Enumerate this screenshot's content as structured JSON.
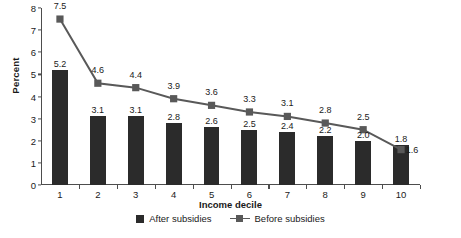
{
  "chart_data": {
    "type": "bar",
    "title": "",
    "xlabel": "Income decile",
    "ylabel": "Percent",
    "categories": [
      "1",
      "2",
      "3",
      "4",
      "5",
      "6",
      "7",
      "8",
      "9",
      "10"
    ],
    "ylim": [
      0,
      8
    ],
    "yticks": [
      "0",
      "1",
      "2",
      "3",
      "4",
      "5",
      "6",
      "7",
      "8"
    ],
    "grid": false,
    "legend_position": "bottom",
    "series": [
      {
        "name": "After subsidies",
        "kind": "bar",
        "color": "#2b2b2b",
        "values": [
          5.2,
          3.1,
          3.1,
          2.8,
          2.6,
          2.5,
          2.4,
          2.2,
          2.0,
          1.8
        ],
        "labels": [
          "5.2",
          "3.1",
          "3.1",
          "2.8",
          "2.6",
          "2.5",
          "2.4",
          "2.2",
          "2.0",
          "1.8"
        ]
      },
      {
        "name": "Before subsidies",
        "kind": "line",
        "color": "#595959",
        "values": [
          7.5,
          4.6,
          4.4,
          3.9,
          3.6,
          3.3,
          3.1,
          2.8,
          2.5,
          1.6
        ],
        "labels": [
          "7.5",
          "4.6",
          "4.4",
          "3.9",
          "3.6",
          "3.3",
          "3.1",
          "2.8",
          "2.5",
          "1.6"
        ]
      }
    ]
  },
  "axes": {
    "y_title": "Percent",
    "x_title": "Income decile"
  },
  "legend": {
    "items": [
      {
        "label": "After subsidies"
      },
      {
        "label": "Before subsidies"
      }
    ]
  }
}
